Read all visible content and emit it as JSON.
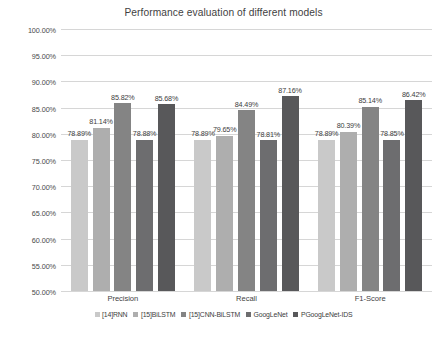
{
  "chart_data": {
    "type": "bar",
    "title": "Performance evaluation of different models",
    "xlabel": "",
    "ylabel": "",
    "categories": [
      "Precision",
      "Recall",
      "F1-Score"
    ],
    "ylim": [
      50,
      100
    ],
    "ytick_labels": [
      "100.00%",
      "95.00%",
      "90.00%",
      "85.00%",
      "80.00%",
      "75.00%",
      "70.00%",
      "65.00%",
      "60.00%",
      "55.00%",
      "50.00%"
    ],
    "ytick_values": [
      100,
      95,
      90,
      85,
      80,
      75,
      70,
      65,
      60,
      55,
      50
    ],
    "grid": true,
    "legend_position": "bottom",
    "value_label_suffix": "%",
    "series": [
      {
        "name": "[14]RNN",
        "color": "#c9c9c9",
        "values": [
          78.89,
          78.89,
          78.89
        ],
        "labels": [
          "78.89%",
          "78.89%",
          "78.89%"
        ]
      },
      {
        "name": "[15]BiLSTM",
        "color": "#aeaeae",
        "values": [
          81.14,
          79.65,
          80.39
        ],
        "labels": [
          "81.14%",
          "79.65%",
          "80.39%"
        ]
      },
      {
        "name": "[15]CNN-BiLSTM",
        "color": "#848484",
        "values": [
          85.82,
          84.49,
          85.14
        ],
        "labels": [
          "85.82%",
          "84.49%",
          "85.14%"
        ]
      },
      {
        "name": "GoogLeNet",
        "color": "#6d6d6f",
        "values": [
          78.88,
          78.81,
          78.85
        ],
        "labels": [
          "78.88%",
          "78.81%",
          "78.85%"
        ]
      },
      {
        "name": "PGoogLeNet-IDS",
        "color": "#58585a",
        "values": [
          85.68,
          87.16,
          86.42
        ],
        "labels": [
          "85.68%",
          "87.16%",
          "86.42%"
        ]
      }
    ]
  }
}
